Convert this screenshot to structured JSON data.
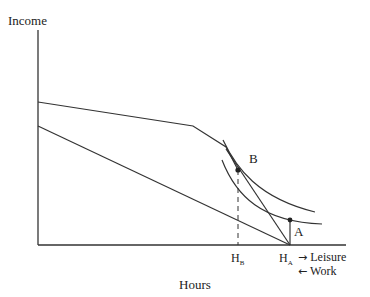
{
  "diagram": {
    "y_axis_label": "Income",
    "x_axis_label": "Hours",
    "points": {
      "A": "A",
      "B": "B"
    },
    "x_ticks": {
      "HB": {
        "main": "H",
        "sub": "B"
      },
      "HA": {
        "main": "H",
        "sub": "A"
      }
    },
    "direction_labels": {
      "leisure": "Leisure",
      "work": "Work",
      "leisure_arrow": "→",
      "work_arrow": "←"
    },
    "colors": {
      "line": "#333333",
      "background": "#ffffff"
    }
  }
}
